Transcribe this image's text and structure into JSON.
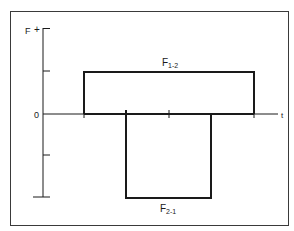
{
  "diagram": {
    "type": "force-time step plot",
    "y_axis": {
      "label": "F",
      "positive_marker": "+",
      "zero_label": "0",
      "ticks": [
        28,
        71,
        114,
        155,
        197
      ]
    },
    "x_axis": {
      "label": "t",
      "ticks": [
        84,
        126,
        169,
        212,
        254
      ]
    },
    "pulses": [
      {
        "name": "F1-2",
        "label_main": "F",
        "label_sub": "1-2",
        "direction": "positive",
        "t_start_tick": 1,
        "t_end_tick": 5,
        "magnitude_ticks": 1
      },
      {
        "name": "F2-1",
        "label_main": "F",
        "label_sub": "2-1",
        "direction": "negative",
        "t_start_tick": 2,
        "t_end_tick": 4,
        "magnitude_ticks": 2
      }
    ],
    "colors": {
      "ink": "#1a1a1a",
      "background": "#ffffff",
      "frame": "#3a3a3a"
    }
  }
}
